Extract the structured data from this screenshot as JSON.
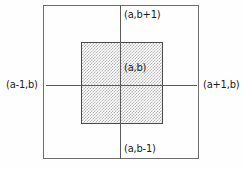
{
  "figure": {
    "background_color": "#ffffff",
    "outer_square": {
      "name": "outer-square",
      "stroke_color": "#6e6e6e",
      "fill": "none"
    },
    "inner_square": {
      "name": "inner-shaded-square",
      "stroke_color": "#4a4a4a",
      "fill_pattern": "stipple",
      "fill_color": "#b9b9b9"
    },
    "axes": {
      "vertical_color": "#5a5a5a",
      "horizontal_color": "#5a5a5a"
    },
    "labels": {
      "center": "(a,b)",
      "top": "(a,b+1)",
      "bottom": "(a,b-1)",
      "left": "(a-1,b)",
      "right": "(a+1,b)"
    }
  }
}
